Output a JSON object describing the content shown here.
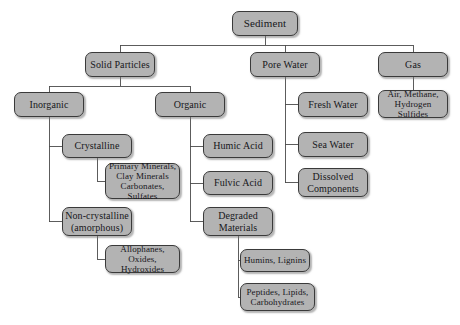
{
  "diagram": {
    "style": {
      "background": "#ffffff",
      "node_fill": "#b3b3b3",
      "node_border": "#3a3a3a",
      "text_color": "#17171b",
      "edge_color": "#4a4a4a"
    },
    "nodes": [
      {
        "id": "sediment",
        "label": "Sediment",
        "x": 232,
        "y": 11,
        "w": 66,
        "h": 25,
        "size": "s11"
      },
      {
        "id": "solid",
        "label": "Solid Particles",
        "x": 85,
        "y": 52,
        "w": 70,
        "h": 25,
        "size": "s10"
      },
      {
        "id": "pore",
        "label": "Pore Water",
        "x": 250,
        "y": 52,
        "w": 70,
        "h": 25,
        "size": "s10"
      },
      {
        "id": "gas",
        "label": "Gas",
        "x": 378,
        "y": 52,
        "w": 70,
        "h": 25,
        "size": "s10"
      },
      {
        "id": "inorganic",
        "label": "Inorganic",
        "x": 14,
        "y": 92,
        "w": 70,
        "h": 25,
        "size": "s10"
      },
      {
        "id": "organic",
        "label": "Organic",
        "x": 155,
        "y": 92,
        "w": 70,
        "h": 25,
        "size": "s10"
      },
      {
        "id": "fresh",
        "label": "Fresh Water",
        "x": 298,
        "y": 92,
        "w": 70,
        "h": 25,
        "size": "s10"
      },
      {
        "id": "airmethane",
        "label": "Air, Methane,\nHydrogen Sulfides",
        "x": 378,
        "y": 90,
        "w": 70,
        "h": 28,
        "size": "s9"
      },
      {
        "id": "crystalline",
        "label": "Crystalline",
        "x": 62,
        "y": 134,
        "w": 70,
        "h": 24,
        "size": "s10"
      },
      {
        "id": "humic",
        "label": "Humic Acid",
        "x": 203,
        "y": 134,
        "w": 70,
        "h": 24,
        "size": "s10"
      },
      {
        "id": "sea",
        "label": "Sea Water",
        "x": 298,
        "y": 132,
        "w": 70,
        "h": 25,
        "size": "s10"
      },
      {
        "id": "primary",
        "label": "Primary Minerals,\nClay Minerals\nCarbonates, Sulfates",
        "x": 105,
        "y": 163,
        "w": 75,
        "h": 36,
        "size": "s9"
      },
      {
        "id": "fulvic",
        "label": "Fulvic Acid",
        "x": 203,
        "y": 171,
        "w": 70,
        "h": 24,
        "size": "s10"
      },
      {
        "id": "dissolved",
        "label": "Dissolved\nComponents",
        "x": 298,
        "y": 168,
        "w": 70,
        "h": 29,
        "size": "s10"
      },
      {
        "id": "noncryst",
        "label": "Non-crystalline\n(amorphous)",
        "x": 62,
        "y": 207,
        "w": 70,
        "h": 29,
        "size": "s10"
      },
      {
        "id": "degraded",
        "label": "Degraded\nMaterials",
        "x": 203,
        "y": 207,
        "w": 70,
        "h": 29,
        "size": "s10"
      },
      {
        "id": "allophanes",
        "label": "Allophanes,\nOxides, Hydroxides",
        "x": 105,
        "y": 245,
        "w": 75,
        "h": 28,
        "size": "s9"
      },
      {
        "id": "humins",
        "label": "Humins, Lignins",
        "x": 240,
        "y": 249,
        "w": 70,
        "h": 23,
        "size": "s9"
      },
      {
        "id": "peptides",
        "label": "Peptides, Lipids,\nCarbohydrates",
        "x": 240,
        "y": 283,
        "w": 75,
        "h": 28,
        "size": "s9"
      }
    ],
    "edges": [
      {
        "from": "sediment",
        "to": "solid",
        "kind": "bus-down"
      },
      {
        "from": "sediment",
        "to": "pore",
        "kind": "bus-down"
      },
      {
        "from": "sediment",
        "to": "gas",
        "kind": "bus-down"
      },
      {
        "from": "solid",
        "to": "inorganic",
        "kind": "bus-down"
      },
      {
        "from": "solid",
        "to": "organic",
        "kind": "bus-down"
      },
      {
        "from": "inorganic",
        "to": "crystalline",
        "kind": "elbow-left"
      },
      {
        "from": "inorganic",
        "to": "noncryst",
        "kind": "elbow-left"
      },
      {
        "from": "crystalline",
        "to": "primary",
        "kind": "elbow-left"
      },
      {
        "from": "noncryst",
        "to": "allophanes",
        "kind": "elbow-left"
      },
      {
        "from": "organic",
        "to": "humic",
        "kind": "elbow-left"
      },
      {
        "from": "organic",
        "to": "fulvic",
        "kind": "elbow-left"
      },
      {
        "from": "organic",
        "to": "degraded",
        "kind": "elbow-left"
      },
      {
        "from": "degraded",
        "to": "humins",
        "kind": "elbow-left"
      },
      {
        "from": "degraded",
        "to": "peptides",
        "kind": "elbow-left"
      },
      {
        "from": "pore",
        "to": "fresh",
        "kind": "elbow-left"
      },
      {
        "from": "pore",
        "to": "sea",
        "kind": "elbow-left"
      },
      {
        "from": "pore",
        "to": "dissolved",
        "kind": "elbow-left"
      },
      {
        "from": "gas",
        "to": "airmethane",
        "kind": "straight-down"
      }
    ]
  }
}
